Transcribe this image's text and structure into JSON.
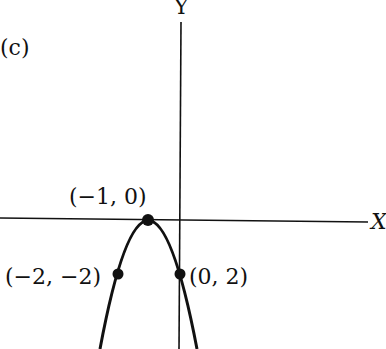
{
  "figure": {
    "panel_label": "(c)",
    "axis_x_label": "X",
    "axis_y_label": "Y",
    "points": [
      {
        "label": "(−1, 0)",
        "x": -1,
        "y": 0
      },
      {
        "label": "(−2, −2)",
        "x": -2,
        "y": -2
      },
      {
        "label": "(0, 2)",
        "x": 0,
        "y": -2
      }
    ],
    "curve": "downward-opening parabola with vertex at (−1, 0)",
    "colors": {
      "ink": "#111111",
      "background": "#ffffff"
    }
  }
}
